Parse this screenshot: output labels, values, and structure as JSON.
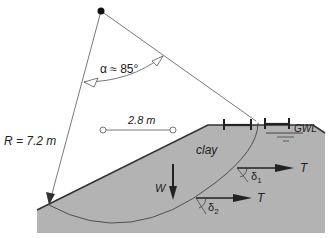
{
  "diagram": {
    "type": "slope-stability-circular-failure",
    "labels": {
      "angle": "α ≈ 85°",
      "radius": "R = 7.2 m",
      "spacing": "2.8 m",
      "material": "clay",
      "groundwater": "GWL",
      "weight": "W",
      "tension1": "T",
      "tension2": "T",
      "delta1": "δ",
      "delta1_sub": "1",
      "delta2": "δ",
      "delta2_sub": "2"
    },
    "colors": {
      "soil": "#b3b3b3",
      "line": "#333333",
      "thin_line": "#555555",
      "center_dot": "#111111"
    }
  }
}
